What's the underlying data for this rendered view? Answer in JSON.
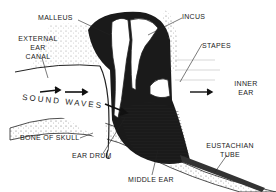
{
  "diagram": {
    "title": "",
    "type": "anatomical cross-section of the human ear",
    "labels": {
      "malleus": "MALLEUS",
      "incus": "INCUS",
      "stapes": "STAPES",
      "external_ear_canal_1": "EXTERNAL",
      "external_ear_canal_2": "EAR",
      "external_ear_canal_3": "CANAL",
      "inner_ear_1": "INNER",
      "inner_ear_2": "EAR",
      "sound_waves": "SOUND WAVES",
      "bone_of_skull": "BONE OF SKULL",
      "ear_drum": "EAR DRUM",
      "middle_ear": "MIDDLE EAR",
      "eustachian_tube_1": "EUSTACHIAN",
      "eustachian_tube_2": "TUBE"
    },
    "colors": {
      "ink": "#1a1a1a",
      "background": "#ffffff",
      "stipple": "#555555"
    }
  }
}
